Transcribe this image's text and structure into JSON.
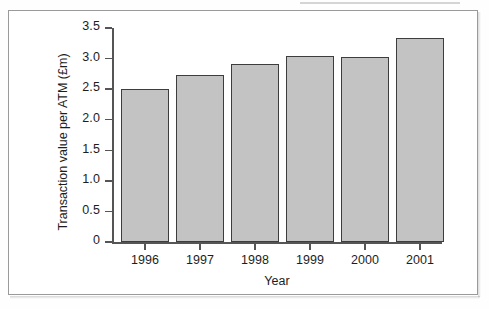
{
  "figure": {
    "background_color": "#ffffff",
    "frame_color": "#9a9a9a",
    "bar_fill_color": "#c3c3c3",
    "bar_border_color": "#3d3d3d",
    "axis_color": "#555555"
  },
  "chart_data": {
    "type": "bar",
    "title": "",
    "xlabel": "Year",
    "ylabel": "Transaction value per ATM (£m)",
    "categories": [
      "1996",
      "1997",
      "1998",
      "1999",
      "2000",
      "2001"
    ],
    "values": [
      2.5,
      2.73,
      2.91,
      3.04,
      3.02,
      3.33
    ],
    "ylim": [
      0,
      3.5
    ],
    "yticks": [
      "0",
      "0.5",
      "1.0",
      "1.5",
      "2.0",
      "2.5",
      "3.0",
      "3.5"
    ],
    "ytick_values": [
      0,
      0.5,
      1.0,
      1.5,
      2.0,
      2.5,
      3.0,
      3.5
    ],
    "grid": false,
    "legend": null,
    "legend_position": "none"
  }
}
